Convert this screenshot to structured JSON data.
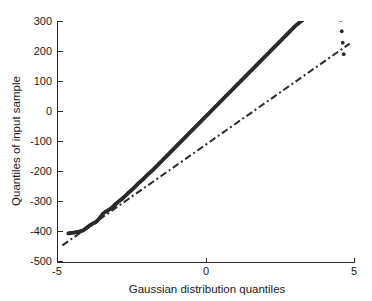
{
  "chart_data": {
    "type": "scatter",
    "title": "",
    "subtitle": "",
    "xlabel": "Gaussian distribution quantiles",
    "ylabel": "Quantiles of input sample",
    "xlim": [
      -5,
      5
    ],
    "ylim": [
      -500,
      300
    ],
    "xticks": [
      -5,
      0,
      5
    ],
    "xtick_labels": [
      "-5",
      "0",
      "5"
    ],
    "yticks": [
      -500,
      -400,
      -300,
      -200,
      -100,
      0,
      100,
      200,
      300
    ],
    "ytick_labels": [
      "-500",
      "-400",
      "-300",
      "-200",
      "-100",
      "0",
      "100",
      "200",
      "300"
    ],
    "grid": false,
    "legend": "none",
    "marker_color": "#2b2b2b",
    "line_color": "#2b2b2b",
    "background_color": "#ffffff",
    "series": [
      {
        "name": "sample quantiles",
        "type": "scatter",
        "marker": "filled-circle",
        "x": [
          -4.62,
          -4.28,
          -4.12,
          -3.92,
          -3.8,
          -3.7,
          -3.62,
          -3.54,
          -3.47,
          -3.4,
          -3.32,
          -3.24,
          -3.16,
          -3.08,
          -3.0,
          -2.92,
          -2.84,
          -2.76,
          -2.68,
          -2.6,
          -2.52,
          -2.44,
          -2.36,
          -2.28,
          -2.2,
          -2.12,
          -2.04,
          -1.96,
          -1.88,
          -1.8,
          -1.72,
          -1.64,
          -1.56,
          -1.48,
          -1.4,
          -1.32,
          -1.24,
          -1.16,
          -1.08,
          -1.0,
          -0.92,
          -0.84,
          -0.76,
          -0.68,
          -0.6,
          -0.52,
          -0.44,
          -0.36,
          -0.28,
          -0.2,
          -0.12,
          -0.04,
          0.04,
          0.12,
          0.2,
          0.28,
          0.36,
          0.44,
          0.52,
          0.6,
          0.68,
          0.76,
          0.84,
          0.92,
          1.0,
          1.08,
          1.16,
          1.24,
          1.32,
          1.4,
          1.48,
          1.56,
          1.64,
          1.72,
          1.8,
          1.88,
          1.96,
          2.04,
          2.12,
          2.2,
          2.28,
          2.36,
          2.44,
          2.52,
          2.6,
          2.68,
          2.76,
          2.84,
          2.92,
          3.0,
          3.1,
          3.2,
          3.3,
          3.42,
          3.56,
          3.7,
          3.84,
          3.98,
          4.1,
          4.22,
          4.34,
          4.46,
          4.62
        ],
        "y": [
          -405,
          -400,
          -395,
          -380,
          -372,
          -368,
          -360,
          -350,
          -340,
          -335,
          -330,
          -325,
          -320,
          -312,
          -305,
          -298,
          -292,
          -285,
          -278,
          -270,
          -263,
          -256,
          -248,
          -240,
          -233,
          -226,
          -218,
          -210,
          -203,
          -196,
          -188,
          -180,
          -172,
          -164,
          -156,
          -148,
          -140,
          -132,
          -124,
          -116,
          -108,
          -100,
          -92,
          -84,
          -76,
          -68,
          -60,
          -52,
          -44,
          -36,
          -28,
          -20,
          -12,
          -4,
          4,
          12,
          20,
          28,
          36,
          44,
          52,
          60,
          68,
          76,
          84,
          92,
          100,
          108,
          116,
          124,
          132,
          140,
          148,
          156,
          164,
          172,
          180,
          188,
          196,
          204,
          212,
          220,
          228,
          236,
          244,
          252,
          260,
          268,
          276,
          284,
          292,
          300,
          308,
          318,
          330,
          342,
          352,
          360,
          368,
          376,
          384,
          380,
          190
        ]
      },
      {
        "name": "reference line",
        "type": "line",
        "style": "dash-dot",
        "x": [
          -4.82,
          4.82
        ],
        "y": [
          -445,
          225
        ]
      }
    ]
  },
  "axes": {
    "x_title": "Gaussian distribution quantiles",
    "y_title": "Quantiles of input sample",
    "x_tick_labels": [
      "-5",
      "0",
      "5"
    ],
    "y_tick_labels": [
      "300",
      "200",
      "100",
      "0",
      "-100",
      "-200",
      "-300",
      "-400",
      "-500"
    ]
  }
}
